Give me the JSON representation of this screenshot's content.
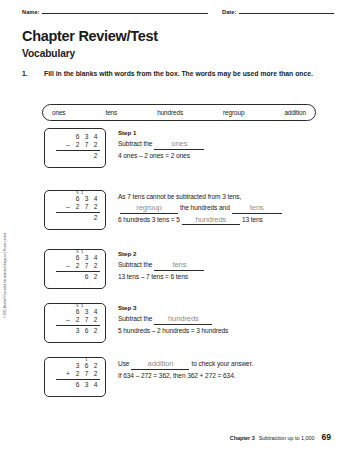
{
  "header": {
    "name_label": "Name:",
    "date_label": "Date:"
  },
  "title": "Chapter Review/Test",
  "subtitle": "Vocabulary",
  "question": {
    "number": "1.",
    "text": "Fill in the blanks with words from the box. The words may be used more than once."
  },
  "word_bank": [
    "ones",
    "tens",
    "hundreds",
    "regroup",
    "addition"
  ],
  "steps": [
    {
      "calc": {
        "rows": [
          {
            "op": "",
            "digits": [
              "6",
              "3",
              "4"
            ],
            "marks": [
              "",
              "",
              ""
            ]
          },
          {
            "op": "–",
            "digits": [
              "2",
              "7",
              "2"
            ],
            "marks": [
              "",
              "",
              ""
            ]
          },
          {
            "op": "",
            "digits": [
              "",
              "",
              "2"
            ],
            "marks": [
              "",
              "",
              ""
            ]
          }
        ]
      },
      "label": "Step 1",
      "line1_pre": "Subtract the",
      "line1_answer": "ones",
      "line1_post": "",
      "line2": "4 ones – 2 ones = 2 ones"
    },
    {
      "calc": {
        "rows": [
          {
            "op": "",
            "digits": [
              "6",
              "3",
              "4"
            ],
            "marks": [
              "5",
              "1",
              ""
            ]
          },
          {
            "op": "–",
            "digits": [
              "2",
              "7",
              "2"
            ],
            "marks": [
              "",
              "",
              ""
            ]
          },
          {
            "op": "",
            "digits": [
              "",
              "",
              "2"
            ],
            "marks": [
              "",
              "",
              ""
            ]
          }
        ]
      },
      "label": "",
      "line1_pre": "As 7 tens cannot be subtracted from 3 tens,",
      "line2_answer_a": "regroup",
      "line2_mid": "the hundreds and",
      "line2_answer_b": "tens",
      "line3_pre": "6 hundreds 3 tens = 5",
      "line3_answer": "hundreds",
      "line3_post": "13 tens"
    },
    {
      "calc": {
        "rows": [
          {
            "op": "",
            "digits": [
              "6",
              "3",
              "4"
            ],
            "marks": [
              "5",
              "1",
              ""
            ]
          },
          {
            "op": "–",
            "digits": [
              "2",
              "7",
              "2"
            ],
            "marks": [
              "",
              "",
              ""
            ]
          },
          {
            "op": "",
            "digits": [
              "",
              "6",
              "2"
            ],
            "marks": [
              "",
              "",
              ""
            ]
          }
        ]
      },
      "label": "Step 2",
      "line1_pre": "Subtract the",
      "line1_answer": "tens",
      "line2": "13 tens – 7 tens = 6 tens"
    },
    {
      "calc": {
        "rows": [
          {
            "op": "",
            "digits": [
              "6",
              "3",
              "4"
            ],
            "marks": [
              "5",
              "1",
              ""
            ]
          },
          {
            "op": "–",
            "digits": [
              "2",
              "7",
              "2"
            ],
            "marks": [
              "",
              "",
              ""
            ]
          },
          {
            "op": "",
            "digits": [
              "3",
              "6",
              "2"
            ],
            "marks": [
              "",
              "",
              ""
            ]
          }
        ]
      },
      "label": "Step 3",
      "line1_pre": "Subtract the",
      "line1_answer": "hundreds",
      "line2": "5 hundreds – 2 hundreds = 3 hundreds"
    },
    {
      "calc": {
        "rows": [
          {
            "op": "",
            "digits": [
              "3",
              "6",
              "2"
            ],
            "marks": [
              "",
              "1",
              ""
            ]
          },
          {
            "op": "+",
            "digits": [
              "2",
              "7",
              "2"
            ],
            "marks": [
              "",
              "",
              ""
            ]
          },
          {
            "op": "",
            "digits": [
              "6",
              "3",
              "4"
            ],
            "marks": [
              "",
              "",
              ""
            ]
          }
        ]
      },
      "label": "",
      "line1_pre": "Use",
      "line1_answer": "addition",
      "line1_post": "to check your answer.",
      "line2": "If 634 – 272 = 362, then 362 + 272 = 634."
    }
  ],
  "copyright": "© 2015 Marshall Cavendish International (Singapore) Private Limited.",
  "footer": {
    "chapter": "Chapter 3",
    "text": "Subtraction up to 1,000",
    "page": "69"
  }
}
